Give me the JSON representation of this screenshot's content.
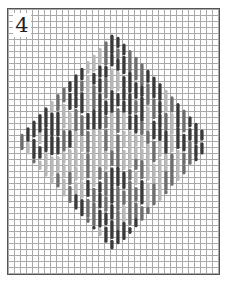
{
  "figure": {
    "number": "4",
    "grid_spacing_px": 6,
    "colors": {
      "grid_line": "#a9a9a9",
      "frame": "#555555",
      "stitch_dark": "#3a3a3a",
      "stitch_mid": "#6e6e6e",
      "stitch_light": "#b8b8b8"
    },
    "diamond": {
      "center_x": 114,
      "center_y": 142,
      "half_width": 98,
      "half_height": 108
    }
  }
}
